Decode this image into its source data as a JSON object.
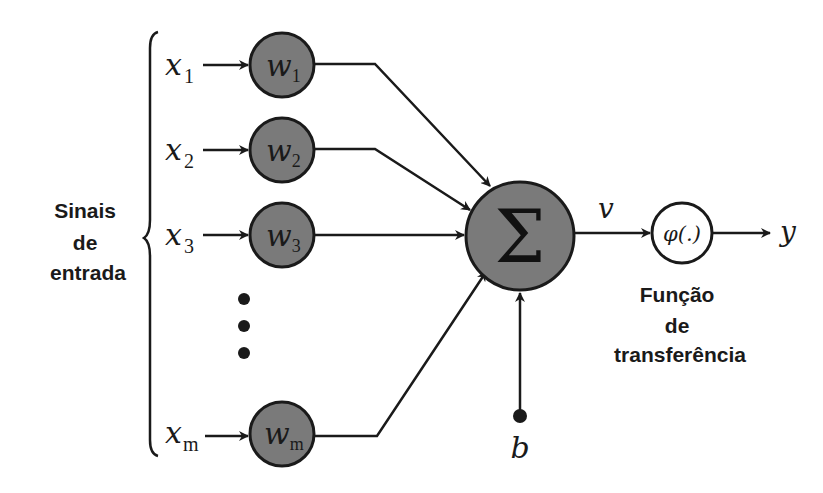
{
  "diagram": {
    "input_group_label": [
      "Sinais",
      "de",
      "entrada"
    ],
    "inputs": [
      {
        "x": "x",
        "x_sub": "1",
        "w": "w",
        "w_sub": "1"
      },
      {
        "x": "x",
        "x_sub": "2",
        "w": "w",
        "w_sub": "2"
      },
      {
        "x": "x",
        "x_sub": "3",
        "w": "w",
        "w_sub": "3"
      },
      {
        "x": "x",
        "x_sub": "m",
        "w": "w",
        "w_sub": "m"
      }
    ],
    "ellipsis": "⋮",
    "summation_symbol": "Σ",
    "bias_label": "b",
    "induced_field_label": "v",
    "activation_label": "φ(.)",
    "output_label": "y",
    "activation_caption": [
      "Função",
      "de",
      "transferência"
    ],
    "colors": {
      "weight_node_fill": "#7a7a7a",
      "summation_node_fill": "#7a7a7a",
      "activation_node_fill": "#ffffff",
      "stroke": "#1a1a1a"
    }
  }
}
